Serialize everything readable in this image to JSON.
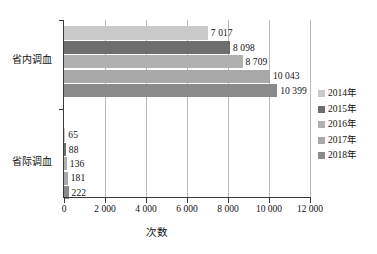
{
  "chart_data": {
    "type": "bar",
    "orientation": "horizontal",
    "title": "",
    "xlabel": "次数",
    "ylabel": "",
    "categories": [
      "省内调血",
      "省际调血"
    ],
    "series": [
      {
        "name": "2014年",
        "color": "#c9c9c9",
        "values": [
          7017,
          65
        ]
      },
      {
        "name": "2015年",
        "color": "#6e6e6e",
        "values": [
          8098,
          88
        ]
      },
      {
        "name": "2016年",
        "color": "#b0b0b0",
        "values": [
          8709,
          136
        ]
      },
      {
        "name": "2017年",
        "color": "#a8a8a8",
        "values": [
          10043,
          181
        ]
      },
      {
        "name": "2018年",
        "color": "#8a8a8a",
        "values": [
          10399,
          222
        ]
      }
    ],
    "value_labels": {
      "省内调血": [
        "7 017",
        "8 098",
        "8 709",
        "10 043",
        "10 399"
      ],
      "省际调血": [
        "65",
        "88",
        "136",
        "181",
        "222"
      ]
    },
    "xlim": [
      0,
      12000
    ],
    "xticks": [
      0,
      2000,
      4000,
      6000,
      8000,
      10000,
      12000
    ],
    "xtick_labels": [
      "0",
      "2 000",
      "4 000",
      "6 000",
      "8 000",
      "10 000",
      "12 000"
    ],
    "grid": "vertical",
    "legend_position": "right"
  },
  "legend": {
    "items": [
      {
        "label": "2014年"
      },
      {
        "label": "2015年"
      },
      {
        "label": "2016年"
      },
      {
        "label": "2017年"
      },
      {
        "label": "2018年"
      }
    ]
  },
  "axis": {
    "x_title": "次数",
    "tick_labels": [
      "0",
      "2 000",
      "4 000",
      "6 000",
      "8 000",
      "10 000",
      "12 000"
    ],
    "category_labels": [
      "省内调血",
      "省际调血"
    ]
  },
  "labels": {
    "g0": [
      "7 017",
      "8 098",
      "8 709",
      "10 043",
      "10 399"
    ],
    "g1": [
      "65",
      "88",
      "136",
      "181",
      "222"
    ]
  }
}
